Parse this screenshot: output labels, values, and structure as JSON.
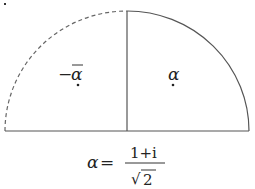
{
  "diagram": {
    "type": "half-disk partition",
    "colors": {
      "stroke": "#555555",
      "text": "#222222",
      "background": "#ffffff"
    },
    "regions": [
      {
        "name": "left-quarter",
        "label_prefix": "−",
        "label": "α",
        "bar": true,
        "boundary": "dashed"
      },
      {
        "name": "right-quarter",
        "label": "α",
        "bar": false,
        "boundary": "solid"
      }
    ],
    "formula": {
      "lhs": "α",
      "eq": "=",
      "numerator": "1+i",
      "denominator_sqrt": "√",
      "denominator": "2"
    }
  }
}
